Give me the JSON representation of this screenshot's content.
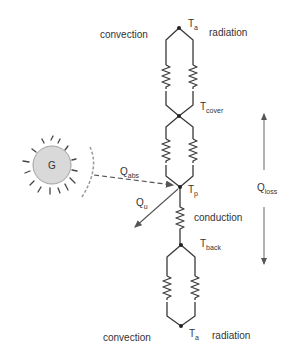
{
  "diagram": {
    "colors": {
      "line": "#3a3a3a",
      "sun_fill": "#d9d9d9",
      "sun_stroke": "#a0a0a0",
      "text": "#333333"
    },
    "nodes": {
      "top_ambient": {
        "label": "T",
        "sub": "a"
      },
      "cover": {
        "label": "T",
        "sub": "cover"
      },
      "plate": {
        "label": "T",
        "sub": "p"
      },
      "back": {
        "label": "T",
        "sub": "back"
      },
      "bottom_ambient": {
        "label": "T",
        "sub": "a"
      }
    },
    "labels": {
      "top_left": "convection",
      "top_right": "radiation",
      "middle": "conduction",
      "bottom_left": "convection",
      "bottom_right": "radiation"
    },
    "sun": {
      "label": "G"
    },
    "flows": {
      "absorbed": {
        "label": "Q",
        "sub": "abs"
      },
      "useful": {
        "label": "Q",
        "sub": "u"
      },
      "loss": {
        "label": "Q",
        "sub": "loss"
      }
    }
  }
}
